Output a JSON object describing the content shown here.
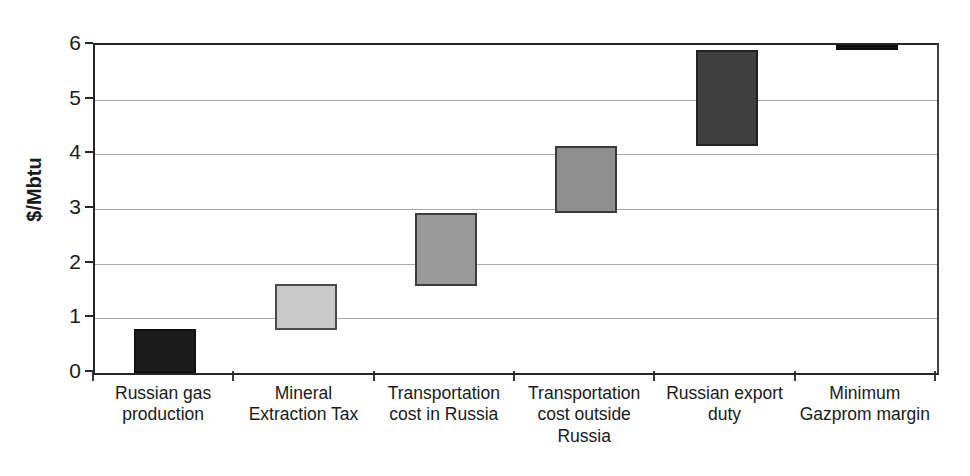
{
  "chart_data": {
    "type": "bar",
    "subtype": "waterfall",
    "title": "",
    "xlabel": "",
    "ylabel": "$/Mbtu",
    "ylim": [
      0,
      6
    ],
    "yticks": [
      "0",
      "1",
      "2",
      "3",
      "4",
      "5",
      "6"
    ],
    "grid": true,
    "legend": "none",
    "categories": [
      "Russian gas production",
      "Mineral Extraction Tax",
      "Transportation cost in Russia",
      "Transportation cost outside Russia",
      "Russian export duty",
      "Minimum Gazprom margin"
    ],
    "category_lines": [
      [
        "Russian gas",
        "production"
      ],
      [
        "Mineral",
        "Extraction Tax"
      ],
      [
        "Transportation",
        "cost in Russia"
      ],
      [
        "Transportation",
        "cost outside",
        "Russia"
      ],
      [
        "Russian export",
        "duty"
      ],
      [
        "Minimum",
        "Gazprom margin"
      ]
    ],
    "bars": [
      {
        "label": "Russian gas production",
        "base": 0.0,
        "top": 0.8,
        "value": 0.8,
        "color": "#1c1c1c",
        "border": "#111111"
      },
      {
        "label": "Mineral Extraction Tax",
        "base": 0.79,
        "top": 1.62,
        "value": 0.83,
        "color": "#c9c9c9",
        "border": "#4a4a4a"
      },
      {
        "label": "Transportation cost in Russia",
        "base": 1.6,
        "top": 2.92,
        "value": 1.32,
        "color": "#9a9a9a",
        "border": "#3c3c3c"
      },
      {
        "label": "Transportation cost outside Russia",
        "base": 2.93,
        "top": 4.15,
        "value": 1.22,
        "color": "#8e8e8e",
        "border": "#3a3a3a"
      },
      {
        "label": "Russian export duty",
        "base": 4.15,
        "top": 5.9,
        "value": 1.75,
        "color": "#3f3f3f",
        "border": "#222222"
      },
      {
        "label": "Minimum Gazprom margin",
        "base": 5.9,
        "top": 6.0,
        "value": 0.1,
        "color": "#151515",
        "border": "#0d0d0d"
      }
    ],
    "values": [
      0.8,
      0.83,
      1.32,
      1.22,
      1.75,
      0.1
    ],
    "cumulative_total": 6.0,
    "axis_colors": {
      "frame": "#262626",
      "gridline": "#a8a8a8",
      "text": "#1a1a1a"
    }
  }
}
